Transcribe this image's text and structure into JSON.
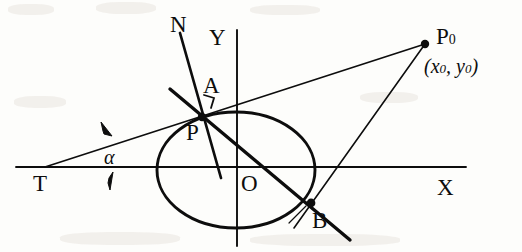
{
  "figure": {
    "type": "geometry-diagram",
    "background_color": "#fdfdfb",
    "ink_color": "#0d0d0d",
    "width": 522,
    "height": 252
  },
  "axes": {
    "x_label": "X",
    "y_label": "Y",
    "origin_label": "O",
    "x_axis": {
      "x1": 16,
      "y1": 167,
      "x2": 466,
      "y2": 167
    },
    "y_axis": {
      "x1": 237,
      "y1": 30,
      "x2": 237,
      "y2": 246
    }
  },
  "ellipse": {
    "cx": 236,
    "cy": 170,
    "rx": 79,
    "ry": 58
  },
  "points": [
    {
      "name": "T",
      "label": "T",
      "x": 45,
      "y": 167,
      "marker": false,
      "label_x": 40,
      "label_y": 171
    },
    {
      "name": "P",
      "label": "P",
      "x": 202,
      "y": 117,
      "marker": true,
      "label_x": 190,
      "label_y": 124
    },
    {
      "name": "A",
      "label": "A",
      "x": 212,
      "y": 96,
      "marker": false,
      "label_x": 204,
      "label_y": 76
    },
    {
      "name": "N",
      "label": "N",
      "x": 180,
      "y": 33,
      "marker": false,
      "label_x": 172,
      "label_y": 14
    },
    {
      "name": "B",
      "label": "B",
      "x": 311,
      "y": 203,
      "marker": true,
      "label_x": 307,
      "label_y": 210
    },
    {
      "name": "O",
      "label": "O",
      "x": 237,
      "y": 167,
      "marker": false,
      "label_x": 243,
      "label_y": 171
    },
    {
      "name": "P0",
      "label": "P",
      "x": 425,
      "y": 44,
      "marker": true,
      "label_x": 436,
      "label_y": 26
    }
  ],
  "labels": {
    "T": "T",
    "P": "P",
    "A": "A",
    "N": "N",
    "B": "B",
    "O": "O",
    "X": "X",
    "Y": "Y",
    "P0_base": "P",
    "P0_sub": "0",
    "coord_open": "(",
    "coord_x": "x",
    "coord_x_sub": "0",
    "coord_comma": ", ",
    "coord_y": "y",
    "coord_y_sub": "0",
    "coord_close": ")",
    "alpha": "α"
  },
  "lines": {
    "tangent_T_to_P0": {
      "x1": 45,
      "y1": 167,
      "x2": 425,
      "y2": 44,
      "width": 1.6,
      "note": "tangent line through P from T to P0"
    },
    "normal_N": {
      "x1": 180,
      "y1": 33,
      "x2": 221,
      "y2": 178,
      "width": 2.6,
      "note": "normal at P, line N"
    },
    "chord_PB": {
      "x1": 170,
      "y1": 89,
      "x2": 350,
      "y2": 240,
      "width": 3.4,
      "note": "thick chord through P and B"
    },
    "secant_P0_B": {
      "x1": 425,
      "y1": 44,
      "x2": 294,
      "y2": 228,
      "width": 1.6,
      "note": "line from P0 through B"
    },
    "tick_B": {
      "x1": 290,
      "y1": 222,
      "x2": 305,
      "y2": 207,
      "width": 1.2,
      "note": "short tick near B"
    }
  },
  "angle_mark": {
    "symbol": "α",
    "vertex": "T",
    "label_x": 104,
    "label_y": 148,
    "arrow_upper": {
      "x": 107,
      "y": 128,
      "note": "arrow pointing down-left toward tangent"
    },
    "arrow_lower": {
      "x": 110,
      "y": 186,
      "note": "arrow pointing up toward x-axis"
    }
  },
  "right_angle_marker": {
    "at_point": "P",
    "note": "small square corner between tangent and normal just above P",
    "x": 206,
    "y": 100,
    "size": 11
  }
}
